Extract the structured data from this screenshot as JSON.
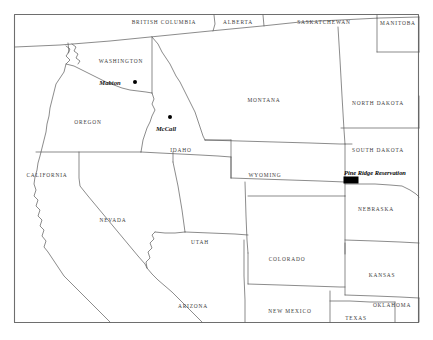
{
  "figure": {
    "type": "reference-map",
    "background_color": "#ffffff",
    "frame_color": "#6e6e6e",
    "border_color": "#5a5a5a",
    "label_color": "#3b3b3b",
    "marker_color": "#000000",
    "frame": {
      "x": 14,
      "y": 14,
      "width": 405,
      "height": 309
    }
  },
  "regions": [
    {
      "name": "british-columbia",
      "label": "BRITISH COLUMBIA",
      "x": 164,
      "y": 22,
      "kind": "province"
    },
    {
      "name": "alberta",
      "label": "ALBERTA",
      "x": 238,
      "y": 22,
      "kind": "province"
    },
    {
      "name": "saskatchewan",
      "label": "SASKATCHEWAN",
      "x": 324,
      "y": 22,
      "kind": "province"
    },
    {
      "name": "manitoba",
      "label": "MANITOBA",
      "x": 398,
      "y": 23,
      "kind": "province"
    },
    {
      "name": "washington",
      "label": "WASHINGTON",
      "x": 121,
      "y": 61,
      "kind": "state"
    },
    {
      "name": "montana",
      "label": "MONTANA",
      "x": 264,
      "y": 100,
      "kind": "state"
    },
    {
      "name": "north-dakota",
      "label": "NORTH DAKOTA",
      "x": 378,
      "y": 103,
      "kind": "state"
    },
    {
      "name": "oregon",
      "label": "OREGON",
      "x": 88,
      "y": 122,
      "kind": "state"
    },
    {
      "name": "idaho",
      "label": "IDAHO",
      "x": 181,
      "y": 150,
      "kind": "state"
    },
    {
      "name": "south-dakota",
      "label": "SOUTH DAKOTA",
      "x": 378,
      "y": 150,
      "kind": "state"
    },
    {
      "name": "wyoming",
      "label": "WYOMING",
      "x": 265,
      "y": 175,
      "kind": "state"
    },
    {
      "name": "california",
      "label": "CALIFORNIA",
      "x": 47,
      "y": 175,
      "kind": "state"
    },
    {
      "name": "nebraska",
      "label": "NEBRASKA",
      "x": 376,
      "y": 209,
      "kind": "state"
    },
    {
      "name": "nevada",
      "label": "NEVADA",
      "x": 113,
      "y": 220,
      "kind": "state"
    },
    {
      "name": "utah",
      "label": "UTAH",
      "x": 200,
      "y": 242,
      "kind": "state"
    },
    {
      "name": "colorado",
      "label": "COLORADO",
      "x": 287,
      "y": 259,
      "kind": "state"
    },
    {
      "name": "kansas",
      "label": "KANSAS",
      "x": 382,
      "y": 275,
      "kind": "state"
    },
    {
      "name": "arizona",
      "label": "ARIZONA",
      "x": 193,
      "y": 306,
      "kind": "state"
    },
    {
      "name": "new-mexico",
      "label": "NEW MEXICO",
      "x": 290,
      "y": 311,
      "kind": "state"
    },
    {
      "name": "oklahoma",
      "label": "OKLAHOMA",
      "x": 392,
      "y": 305,
      "kind": "state"
    },
    {
      "name": "texas",
      "label": "TEXAS",
      "x": 356,
      "y": 318,
      "kind": "state"
    }
  ],
  "cities": [
    {
      "name": "mabton",
      "label": "Mabton",
      "label_x": 110,
      "label_y": 82,
      "dot_x": 135,
      "dot_y": 82
    },
    {
      "name": "mccall",
      "label": "McCall",
      "label_x": 166,
      "label_y": 128,
      "dot_x": 170,
      "dot_y": 117
    }
  ],
  "sites": [
    {
      "name": "pine-ridge-reservation",
      "label": "Pine Ridge Reservation",
      "label_x": 375,
      "label_y": 172,
      "marker_x": 351,
      "marker_y": 180,
      "marker_width": 15,
      "marker_height": 7
    }
  ]
}
